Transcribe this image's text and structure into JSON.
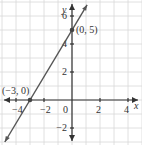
{
  "chart_data": {
    "type": "line",
    "title": "",
    "xlabel": "x",
    "ylabel": "y",
    "xlim": [
      -5,
      5
    ],
    "ylim": [
      -3,
      7
    ],
    "grid": true,
    "x_ticks": [
      -4,
      -2,
      0,
      2,
      4
    ],
    "y_ticks": [
      -2,
      2,
      4,
      6
    ],
    "x_tick_labels": [
      "−4",
      "−2",
      "0",
      "2",
      "4"
    ],
    "y_tick_labels": [
      "−2",
      "2",
      "4",
      "6"
    ],
    "series": [
      {
        "name": "line",
        "equation": "y = (5/3)x + 5",
        "slope": 1.6667,
        "intercept": 5,
        "color": "#555555"
      }
    ],
    "points": [
      {
        "x": -3,
        "y": 0,
        "label": "(−3, 0)"
      },
      {
        "x": 0,
        "y": 5,
        "label": "(0, 5)"
      }
    ]
  }
}
